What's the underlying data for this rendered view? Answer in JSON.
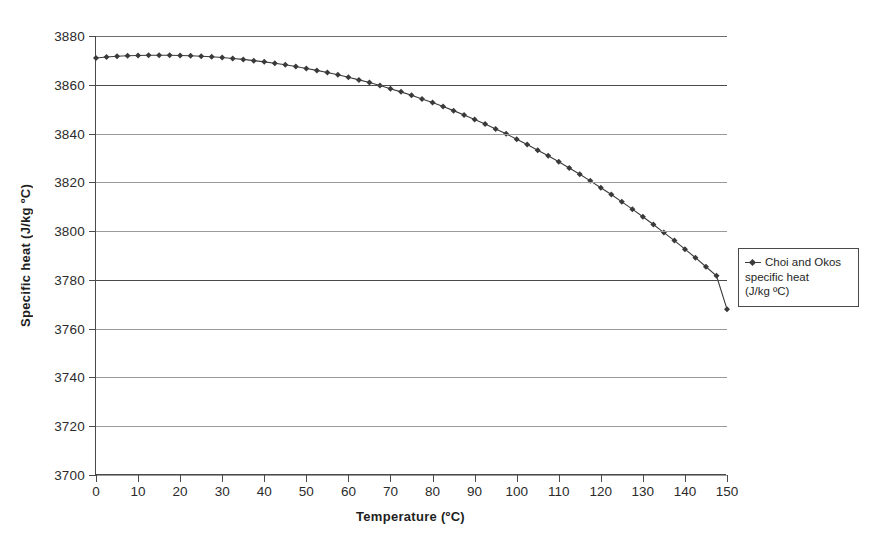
{
  "chart_data": {
    "type": "line",
    "title": "",
    "xlabel": "Temperature (ºC)",
    "ylabel": "Specific heat (J/kg ºC)",
    "xlim": [
      0,
      150
    ],
    "ylim": [
      3700,
      3880
    ],
    "xticks": [
      0,
      10,
      20,
      30,
      40,
      50,
      60,
      70,
      80,
      90,
      100,
      110,
      120,
      130,
      140,
      150
    ],
    "yticks": [
      3700,
      3720,
      3740,
      3760,
      3780,
      3800,
      3820,
      3840,
      3860,
      3880
    ],
    "grid": "horizontal",
    "legend_position": "right",
    "marker": "diamond",
    "marker_color": "#3a3a3a",
    "line_color": "#3a3a3a",
    "series": [
      {
        "name": "Choi and Okos specific heat (J/kg ºC)",
        "x": [
          0,
          2.5,
          5,
          7.5,
          10,
          12.5,
          15,
          17.5,
          20,
          22.5,
          25,
          27.5,
          30,
          32.5,
          35,
          37.5,
          40,
          42.5,
          45,
          47.5,
          50,
          52.5,
          55,
          57.5,
          60,
          62.5,
          65,
          67.5,
          70,
          72.5,
          75,
          77.5,
          80,
          82.5,
          85,
          87.5,
          90,
          92.5,
          95,
          97.5,
          100,
          102.5,
          105,
          107.5,
          110,
          112.5,
          115,
          117.5,
          120,
          122.5,
          125,
          127.5,
          130,
          132.5,
          135,
          137.5,
          140,
          142.5,
          145,
          147.5,
          150
        ],
        "y": [
          3871.0,
          3871.4,
          3871.7,
          3871.9,
          3872.0,
          3872.1,
          3872.1,
          3872.1,
          3872.0,
          3871.9,
          3871.7,
          3871.5,
          3871.2,
          3870.8,
          3870.4,
          3869.9,
          3869.4,
          3868.8,
          3868.2,
          3867.5,
          3866.7,
          3865.9,
          3865.0,
          3864.1,
          3863.1,
          3862.0,
          3860.9,
          3859.7,
          3858.4,
          3857.1,
          3855.7,
          3854.2,
          3852.7,
          3851.1,
          3849.4,
          3847.6,
          3845.8,
          3843.9,
          3841.9,
          3839.9,
          3837.7,
          3835.5,
          3833.2,
          3830.9,
          3828.4,
          3825.9,
          3823.3,
          3820.6,
          3817.8,
          3815.0,
          3812.0,
          3809.0,
          3805.9,
          3802.7,
          3799.4,
          3796.1,
          3792.6,
          3789.1,
          3785.4,
          3781.7,
          3768.0
        ]
      }
    ]
  },
  "legend": {
    "line1": "Choi and Okos",
    "line2": "specific heat",
    "line3": "(J/kg ºC)"
  }
}
